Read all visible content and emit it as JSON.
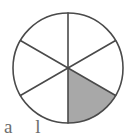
{
  "figure": {
    "name": "fraction-circle",
    "type": "pie",
    "stroke_color": "#4a4a4a",
    "stroke_width": 1.6,
    "background_color": "#ffffff",
    "unshaded_fill": "#ffffff",
    "shaded_fill": "#a8a8a8",
    "center_x": 68,
    "center_y": 68,
    "radius": 55
  },
  "chart_data": {
    "type": "pie",
    "title": "",
    "total_sectors": 6,
    "shaded_sectors": 1,
    "fraction": "1/6",
    "sector_angle_degrees": 60,
    "legend": [],
    "categories": [
      "sector-1",
      "sector-2",
      "sector-3",
      "sector-4",
      "sector-5",
      "sector-6"
    ],
    "values": [
      1,
      1,
      1,
      1,
      1,
      1
    ],
    "sectors": [
      {
        "id": "sector-1",
        "start_deg": 270,
        "end_deg": 330,
        "shaded": false
      },
      {
        "id": "sector-2",
        "start_deg": 330,
        "end_deg": 30,
        "shaded": false
      },
      {
        "id": "sector-3",
        "start_deg": 30,
        "end_deg": 90,
        "shaded": true
      },
      {
        "id": "sector-4",
        "start_deg": 90,
        "end_deg": 150,
        "shaded": false
      },
      {
        "id": "sector-5",
        "start_deg": 150,
        "end_deg": 210,
        "shaded": false
      },
      {
        "id": "sector-6",
        "start_deg": 210,
        "end_deg": 270,
        "shaded": false
      }
    ],
    "diameters": [
      {
        "id": "diameter-vertical",
        "x1": 68,
        "y1": 13,
        "x2": 68,
        "y2": 123
      },
      {
        "id": "diameter-upper-left-to-lower-right",
        "x1": 20.4,
        "y1": 40.5,
        "x2": 115.6,
        "y2": 95.5
      },
      {
        "id": "diameter-lower-left-to-upper-right",
        "x1": 20.4,
        "y1": 95.5,
        "x2": 115.6,
        "y2": 40.5
      }
    ],
    "xlabel": "",
    "ylabel": "",
    "grid": false
  },
  "caption": {
    "text": "a l",
    "note": "partially cropped text at bottom edge"
  }
}
